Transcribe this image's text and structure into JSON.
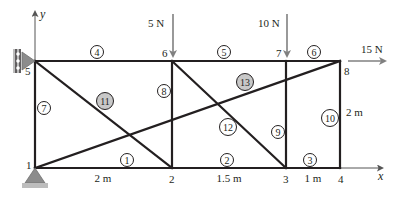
{
  "diagram": {
    "type": "truss",
    "axes": {
      "x_label": "x",
      "y_label": "y"
    },
    "nodes": [
      {
        "id": "1",
        "label": "1",
        "x": 35,
        "y": 168
      },
      {
        "id": "2",
        "label": "2",
        "x": 172,
        "y": 168
      },
      {
        "id": "3",
        "label": "3",
        "x": 286,
        "y": 168
      },
      {
        "id": "4",
        "label": "4",
        "x": 340,
        "y": 168
      },
      {
        "id": "5",
        "label": "5",
        "x": 35,
        "y": 61
      },
      {
        "id": "6",
        "label": "6",
        "x": 172,
        "y": 61
      },
      {
        "id": "7",
        "label": "7",
        "x": 286,
        "y": 61
      },
      {
        "id": "8",
        "label": "8",
        "x": 340,
        "y": 61
      }
    ],
    "members": [
      {
        "id": "1",
        "label": "1",
        "from": "1",
        "to": "2",
        "shaded": false
      },
      {
        "id": "2",
        "label": "2",
        "from": "2",
        "to": "3",
        "shaded": false
      },
      {
        "id": "3",
        "label": "3",
        "from": "3",
        "to": "4",
        "shaded": false
      },
      {
        "id": "4",
        "label": "4",
        "from": "5",
        "to": "6",
        "shaded": false
      },
      {
        "id": "5",
        "label": "5",
        "from": "6",
        "to": "7",
        "shaded": false
      },
      {
        "id": "6",
        "label": "6",
        "from": "7",
        "to": "8",
        "shaded": false
      },
      {
        "id": "7",
        "label": "7",
        "from": "1",
        "to": "5",
        "shaded": false
      },
      {
        "id": "8",
        "label": "8",
        "from": "2",
        "to": "6",
        "shaded": false
      },
      {
        "id": "9",
        "label": "9",
        "from": "3",
        "to": "7",
        "shaded": false
      },
      {
        "id": "10",
        "label": "10",
        "from": "4",
        "to": "8",
        "shaded": false
      },
      {
        "id": "11",
        "label": "11",
        "from": "5",
        "to": "2",
        "shaded": true
      },
      {
        "id": "12",
        "label": "12",
        "from": "6",
        "to": "3",
        "shaded": false
      },
      {
        "id": "13",
        "label": "13",
        "from": "1",
        "to": "8",
        "shaded": true
      }
    ],
    "loads": [
      {
        "label": "5 N",
        "node": "6",
        "direction": "down"
      },
      {
        "label": "10 N",
        "node": "7",
        "direction": "down"
      },
      {
        "label": "15 N",
        "node": "8",
        "direction": "right"
      }
    ],
    "supports": [
      {
        "node": "1",
        "type": "pin"
      },
      {
        "node": "5",
        "type": "roller-wall"
      }
    ],
    "dimensions": [
      {
        "label": "2 m",
        "between": [
          "1",
          "2"
        ]
      },
      {
        "label": "1.5 m",
        "between": [
          "2",
          "3"
        ]
      },
      {
        "label": "1 m",
        "between": [
          "3",
          "4"
        ]
      },
      {
        "label": "2 m",
        "between": [
          "4",
          "8"
        ]
      }
    ],
    "colors": {
      "member": "#231f20",
      "load_arrow": "#808080",
      "support": "#8c8c8c",
      "shaded_circle": "#c8c8c8"
    }
  }
}
